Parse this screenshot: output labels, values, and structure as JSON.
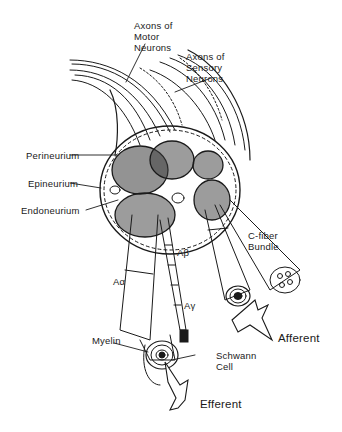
{
  "figure": {
    "labels": {
      "axons_motor": [
        "Axons of",
        "Motor",
        "Neurons"
      ],
      "axons_sensory": [
        "Axons of",
        "Sensory",
        "Neurons"
      ],
      "perineurium": "Perineurium",
      "epineurium": "Epineurium",
      "endoneurium": "Endoneurium",
      "c_fiber": [
        "C-fiber",
        "Bundle"
      ],
      "a_beta": "Aβ",
      "a_alpha": "Aα",
      "a_gamma": "Aγ",
      "myelin": "Myelin",
      "schwann": [
        "Schwann",
        "Cell"
      ],
      "afferent": "Afferent",
      "efferent": "Efferent"
    },
    "colors": {
      "ink": "#1a1a1a",
      "background": "#ffffff",
      "fascicle_fill": "#3a3a3a"
    }
  }
}
